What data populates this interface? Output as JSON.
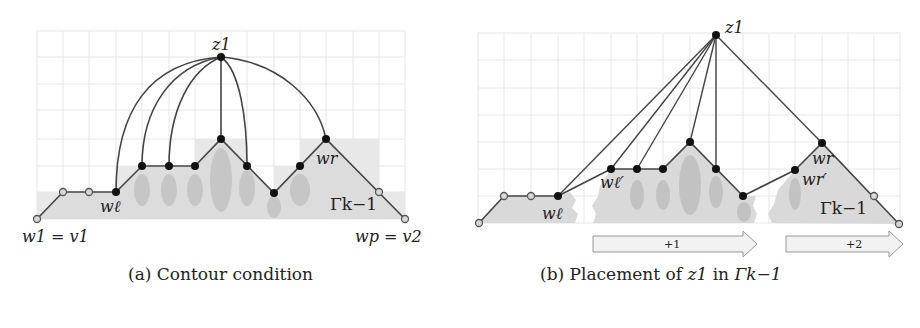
{
  "figure": {
    "panels": [
      {
        "id": "a",
        "caption": "(a) Contour condition",
        "labels": {
          "z1": "z1",
          "w_ell": "wℓ",
          "w_r": "wr",
          "w1_v1": "w1 = v1",
          "wp_v2": "wp = v2",
          "gamma": "Γk−1"
        }
      },
      {
        "id": "b",
        "caption_prefix": "(b) Placement of ",
        "caption_var": "z1",
        "caption_mid": " in ",
        "caption_gamma": "Γk−1",
        "labels": {
          "z1": "z1",
          "w_ell": "wℓ",
          "w_ell_prime": "wℓ′",
          "w_r": "wr",
          "w_r_prime": "wr′",
          "gamma": "Γk−1"
        },
        "arrows": [
          {
            "label": "+1"
          },
          {
            "label": "+2"
          }
        ]
      }
    ],
    "colors": {
      "grid": "#e4e4e4",
      "shade": "#e2e2e2",
      "shade_dark": "#cfcfcf",
      "blob": "#c4c4c4",
      "edge": "#444444",
      "node_black": "#111111",
      "node_open_fill": "#d8d8d8"
    }
  }
}
